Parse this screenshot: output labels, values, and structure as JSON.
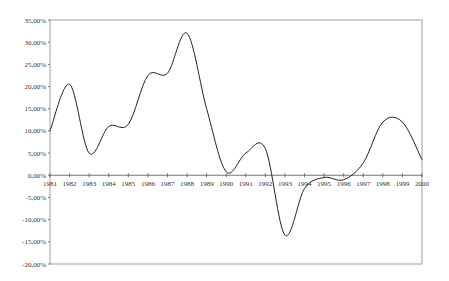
{
  "chart_data": {
    "type": "line",
    "title": "",
    "xlabel": "",
    "ylabel": "",
    "x": [
      "1981",
      "1982",
      "1983",
      "1984",
      "1985",
      "1986",
      "1987",
      "1988",
      "1989",
      "1990",
      "1991",
      "1992",
      "1993",
      "1994",
      "1995",
      "1996",
      "1997",
      "1998",
      "1999",
      "2000"
    ],
    "series": [
      {
        "name": "",
        "values": [
          10.0,
          20.5,
          5.0,
          11.0,
          11.5,
          22.5,
          23.0,
          32.0,
          15.0,
          0.8,
          5.0,
          6.0,
          -13.5,
          -3.0,
          -0.5,
          -1.0,
          2.8,
          12.0,
          12.0,
          3.5
        ]
      }
    ],
    "ylim": [
      -20,
      35
    ],
    "yticks": [
      35,
      30,
      25,
      20,
      15,
      10,
      5,
      0,
      -5,
      -10,
      -15,
      -20
    ],
    "ytick_labels": [
      "35,00%",
      "30,00%",
      "25,00%",
      "20,00%",
      "15,00%",
      "10,00%",
      "5,00%",
      "0,00%",
      "-5,00%",
      "-10,00%",
      "-15,00%",
      "-20,00%"
    ],
    "grid": false,
    "legend": false,
    "smooth": true,
    "line_color": "#222222"
  }
}
